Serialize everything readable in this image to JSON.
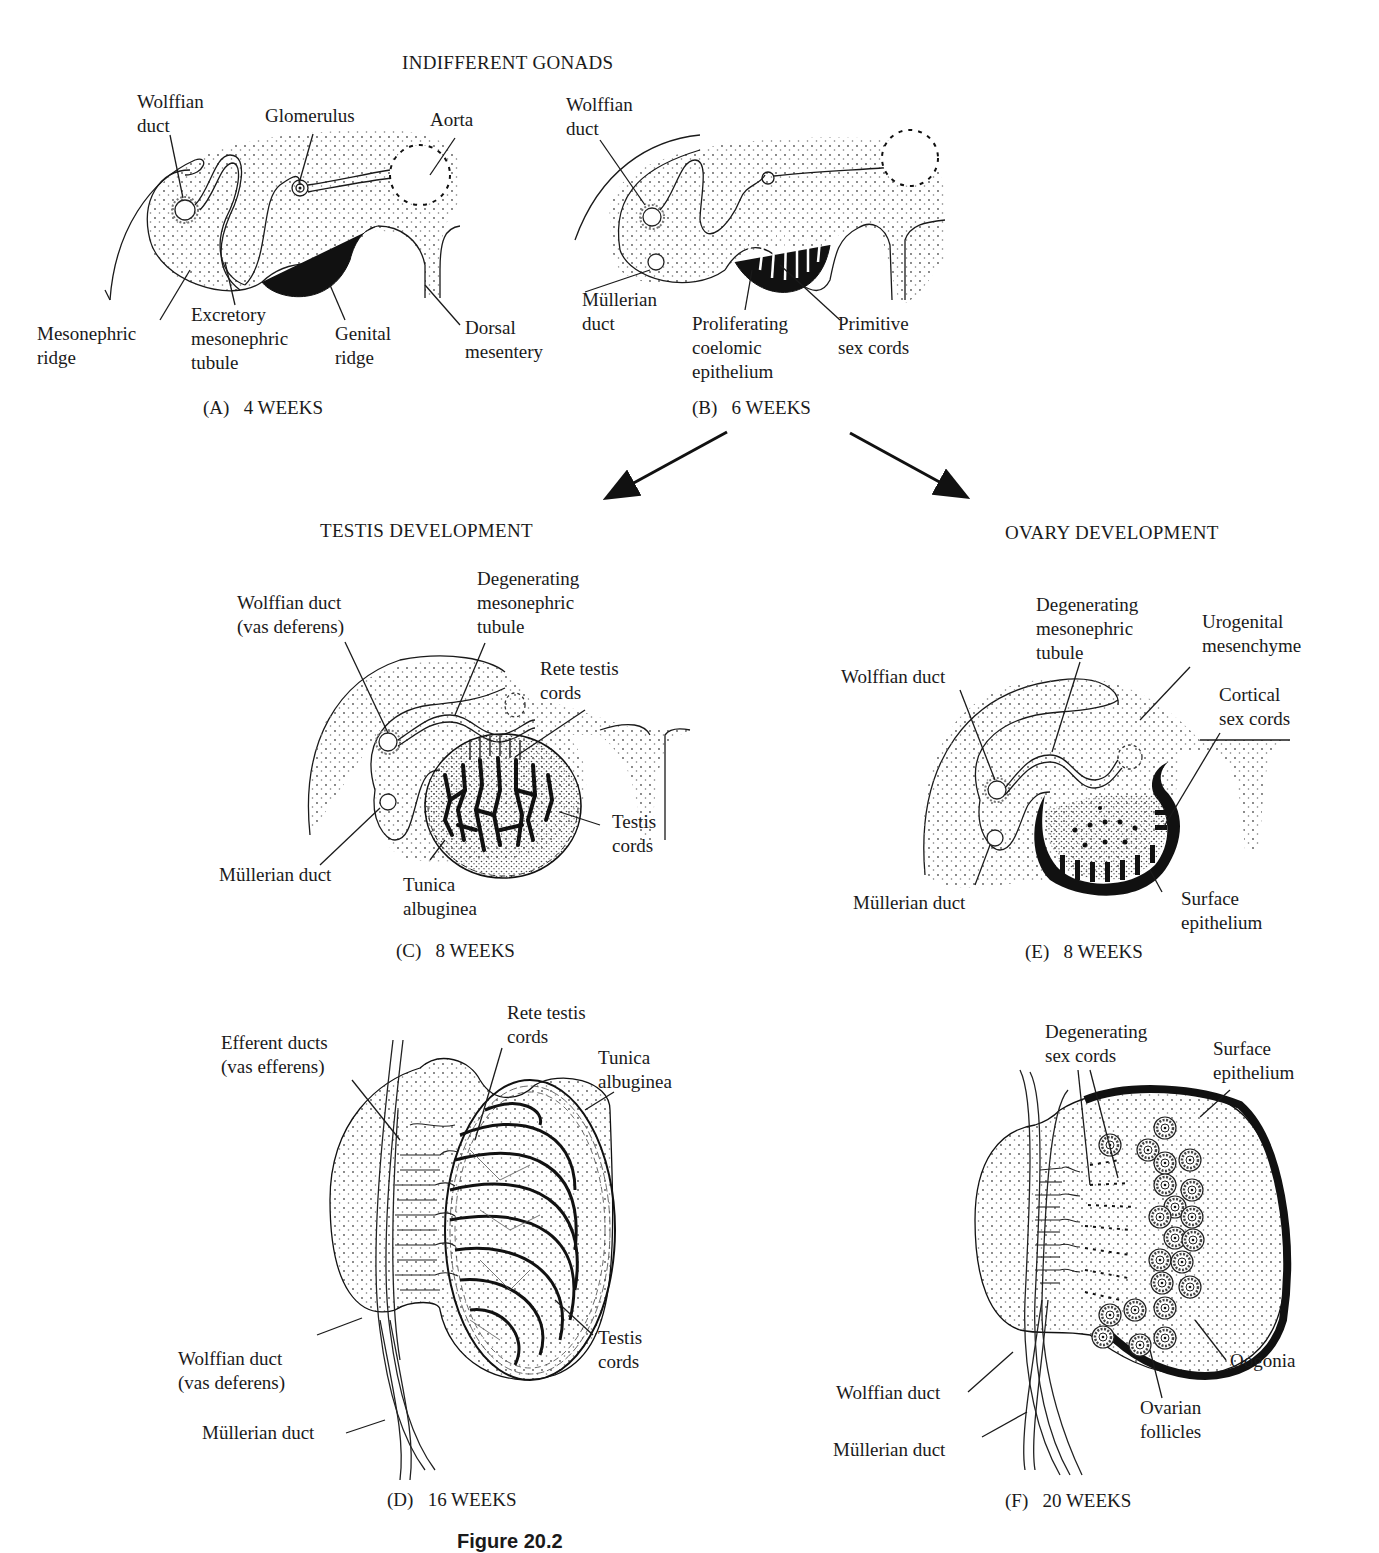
{
  "headers": {
    "indifferent": "INDIFFERENT GONADS",
    "testis": "TESTIS DEVELOPMENT",
    "ovary": "OVARY DEVELOPMENT"
  },
  "panels": {
    "A": {
      "caption": "(A)   4 WEEKS",
      "labels": {
        "wolffian_duct": "Wolffian\nduct",
        "glomerulus": "Glomerulus",
        "aorta": "Aorta",
        "mesonephric_ridge": "Mesonephric\nridge",
        "excretory_tubule": "Excretory\nmesonephric\ntubule",
        "genital_ridge": "Genital\nridge",
        "dorsal_mesentery": "Dorsal\nmesentery"
      }
    },
    "B": {
      "caption": "(B)   6 WEEKS",
      "labels": {
        "wolffian_duct": "Wolffian\nduct",
        "mullerian_duct": "Müllerian\nduct",
        "proliferating_epithelium": "Proliferating\ncoelomic\nepithelium",
        "primitive_sex_cords": "Primitive\nsex cords"
      }
    },
    "C": {
      "caption": "(C)   8 WEEKS",
      "labels": {
        "wolffian_duct": "Wolffian duct\n(vas deferens)",
        "degenerating_tubule": "Degenerating\nmesonephric\ntubule",
        "rete_testis": "Rete testis\ncords",
        "testis_cords": "Testis\ncords",
        "mullerian_duct": "Müllerian duct",
        "tunica_albuginea": "Tunica\nalbuginea"
      }
    },
    "D": {
      "caption": "(D)   16 WEEKS",
      "labels": {
        "efferent_ducts": "Efferent ducts\n(vas efferens)",
        "rete_testis": "Rete testis\ncords",
        "tunica_albuginea": "Tunica\nalbuginea",
        "testis_cords": "Testis\ncords",
        "wolffian_duct": "Wolffian duct\n(vas deferens)",
        "mullerian_duct": "Müllerian duct"
      }
    },
    "E": {
      "caption": "(E)   8 WEEKS",
      "labels": {
        "degenerating_tubule": "Degenerating\nmesonephric\ntubule",
        "urogenital_mesenchyme": "Urogenital\nmesenchyme",
        "wolffian_duct": "Wolffian duct",
        "cortical_sex_cords": "Cortical\nsex cords",
        "mullerian_duct": "Müllerian duct",
        "surface_epithelium": "Surface\nepithelium"
      }
    },
    "F": {
      "caption": "(F)   20 WEEKS",
      "labels": {
        "degenerating_sex_cords": "Degenerating\nsex cords",
        "surface_epithelium": "Surface\nepithelium",
        "oogonia": "Oogonia",
        "ovarian_follicles": "Ovarian\nfollicles",
        "wolffian_duct": "Wolffian duct",
        "mullerian_duct": "Müllerian duct"
      }
    }
  },
  "figure_caption": "Figure 20.2"
}
